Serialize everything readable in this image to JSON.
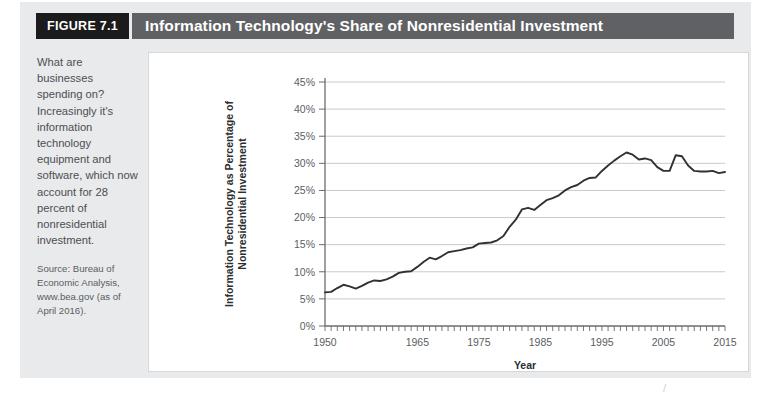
{
  "figure": {
    "badge": "FIGURE 7.1",
    "title": "Information Technology's Share of Nonresidential Investment",
    "caption": "What are businesses spending on? Increasingly it's information technology equipment and software, which now account for 28 percent of nonresidential investment.",
    "source": "Source: Bureau of Economic Analysis, www.bea.gov (as of April 2016).",
    "scan_mark": "/"
  },
  "colors": {
    "badge_bg": "#1b1b1b",
    "title_bg": "#5f6164",
    "block_bg": "#e9eaec",
    "panel_bg": "#ffffff",
    "line": "#2f3133",
    "grid": "#c9cacc"
  },
  "chart_data": {
    "type": "line",
    "title": "Information Technology's Share of Nonresidential Investment",
    "xlabel": "Year",
    "ylabel": "Information Technology as Percentage of Nonresidential Investment",
    "xlim": [
      1950,
      2015
    ],
    "ylim": [
      0,
      45
    ],
    "grid": true,
    "legend": "none",
    "ytick_labels": [
      "0%",
      "5%",
      "10%",
      "15%",
      "20%",
      "25%",
      "30%",
      "35%",
      "40%",
      "45%"
    ],
    "ytick_values": [
      0,
      5,
      10,
      15,
      20,
      25,
      30,
      35,
      40,
      45
    ],
    "xtick_labels": [
      "1950",
      "1965",
      "1975",
      "1985",
      "1995",
      "2005",
      "2015"
    ],
    "xtick_values": [
      1950,
      1965,
      1975,
      1985,
      1995,
      2005,
      2015
    ],
    "minor_tick_interval": 1,
    "series": [
      {
        "name": "IT share of nonresidential investment",
        "x": [
          1950,
          1951,
          1952,
          1953,
          1954,
          1955,
          1956,
          1957,
          1958,
          1959,
          1960,
          1961,
          1962,
          1963,
          1964,
          1965,
          1966,
          1967,
          1968,
          1969,
          1970,
          1971,
          1972,
          1973,
          1974,
          1975,
          1976,
          1977,
          1978,
          1979,
          1980,
          1981,
          1982,
          1983,
          1984,
          1985,
          1986,
          1987,
          1988,
          1989,
          1990,
          1991,
          1992,
          1993,
          1994,
          1995,
          1996,
          1997,
          1998,
          1999,
          2000,
          2001,
          2002,
          2003,
          2004,
          2005,
          2006,
          2007,
          2008,
          2009,
          2010,
          2011,
          2012,
          2013,
          2014,
          2015
        ],
        "values": [
          6.2,
          6.3,
          7.0,
          7.6,
          7.3,
          6.9,
          7.4,
          8.0,
          8.4,
          8.3,
          8.6,
          9.1,
          9.8,
          10.0,
          10.1,
          10.9,
          11.8,
          12.6,
          12.3,
          12.9,
          13.6,
          13.8,
          14.0,
          14.3,
          14.5,
          15.2,
          15.3,
          15.4,
          15.8,
          16.6,
          18.3,
          19.6,
          21.5,
          21.8,
          21.4,
          22.3,
          23.2,
          23.6,
          24.1,
          25.0,
          25.6,
          26.0,
          26.8,
          27.3,
          27.4,
          28.6,
          29.6,
          30.5,
          31.3,
          32.0,
          31.6,
          30.7,
          30.9,
          30.6,
          29.3,
          28.6,
          28.6,
          31.5,
          31.3,
          29.6,
          28.6,
          28.5,
          28.5,
          28.6,
          28.2,
          28.4
        ]
      }
    ]
  }
}
